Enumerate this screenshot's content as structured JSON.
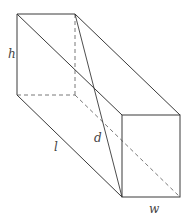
{
  "figure": {
    "type": "rectangular-prism-diagram",
    "labels": {
      "height": "h",
      "length": "l",
      "diagonal": "d",
      "width": "w"
    }
  },
  "colors": {
    "line": "#3a3a3a",
    "dashed": "#6a6a6a",
    "label": "#444444",
    "background": "#ffffff"
  }
}
